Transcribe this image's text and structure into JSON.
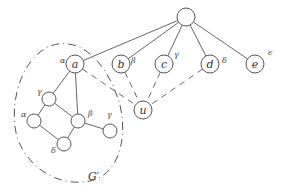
{
  "diagram": {
    "nodes": [
      {
        "id": "root",
        "label": "",
        "x": 186,
        "y": 17,
        "r": 9
      },
      {
        "id": "a",
        "label": "a",
        "x": 75,
        "y": 64,
        "r": 9,
        "greek": "α",
        "gx": 60,
        "gy": 63
      },
      {
        "id": "b",
        "label": "b",
        "x": 121,
        "y": 64,
        "r": 9,
        "greek": "β",
        "gx": 131,
        "gy": 63
      },
      {
        "id": "c",
        "label": "c",
        "x": 164,
        "y": 64,
        "r": 9,
        "greek": "γ",
        "gx": 174,
        "gy": 57
      },
      {
        "id": "d",
        "label": "d",
        "x": 210,
        "y": 64,
        "r": 9,
        "greek": "δ",
        "gx": 222,
        "gy": 63
      },
      {
        "id": "e",
        "label": "e",
        "x": 255,
        "y": 64,
        "r": 9,
        "greek": "ϵ",
        "gx": 268,
        "gy": 55
      },
      {
        "id": "u",
        "label": "u",
        "x": 143,
        "y": 110,
        "r": 9
      },
      {
        "id": "g1",
        "label": "",
        "x": 49,
        "y": 99,
        "r": 7,
        "greek": "γ",
        "gx": 37,
        "gy": 94
      },
      {
        "id": "g2",
        "label": "",
        "x": 34,
        "y": 121,
        "r": 7,
        "greek": "α",
        "gx": 21,
        "gy": 117
      },
      {
        "id": "g3",
        "label": "",
        "x": 78,
        "y": 121,
        "r": 7,
        "greek": "β",
        "gx": 88,
        "gy": 116
      },
      {
        "id": "g4",
        "label": "",
        "x": 110,
        "y": 131,
        "r": 7,
        "greek": "γ",
        "gx": 107,
        "gy": 117
      },
      {
        "id": "g5",
        "label": "",
        "x": 64,
        "y": 144,
        "r": 7,
        "greek": "δ",
        "gx": 51,
        "gy": 153
      }
    ],
    "edges_solid": [
      [
        "root",
        "a"
      ],
      [
        "root",
        "b"
      ],
      [
        "root",
        "c"
      ],
      [
        "root",
        "d"
      ],
      [
        "root",
        "e"
      ],
      [
        "a",
        "g1"
      ],
      [
        "a",
        "g3"
      ],
      [
        "g1",
        "g2"
      ],
      [
        "g1",
        "g3"
      ],
      [
        "g2",
        "g5"
      ],
      [
        "g3",
        "g5"
      ],
      [
        "g3",
        "g4"
      ]
    ],
    "edges_dashed": [
      [
        "a",
        "u"
      ],
      [
        "b",
        "u"
      ],
      [
        "c",
        "u"
      ],
      [
        "d",
        "u"
      ]
    ],
    "subgraph": {
      "label": "G′",
      "lx": 88,
      "ly": 178
    },
    "colors": {
      "stroke": "#555555",
      "text": "#333333",
      "background": "#ffffff"
    }
  }
}
